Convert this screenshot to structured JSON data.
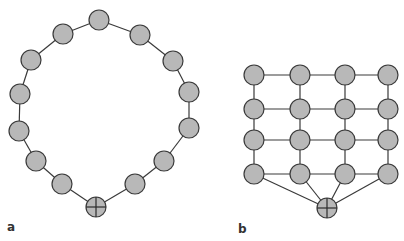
{
  "panels": [
    {
      "label": "a",
      "topology": "ring",
      "node_radius": 10,
      "nodes": [
        {
          "x": 99,
          "y": 20
        },
        {
          "x": 140,
          "y": 35
        },
        {
          "x": 173,
          "y": 61
        },
        {
          "x": 189,
          "y": 92
        },
        {
          "x": 189,
          "y": 128
        },
        {
          "x": 164,
          "y": 161
        },
        {
          "x": 135,
          "y": 184
        },
        {
          "x": 96,
          "y": 207,
          "hub": true
        },
        {
          "x": 62,
          "y": 184
        },
        {
          "x": 36,
          "y": 161
        },
        {
          "x": 19,
          "y": 131
        },
        {
          "x": 20,
          "y": 94
        },
        {
          "x": 31,
          "y": 60
        },
        {
          "x": 63,
          "y": 34
        }
      ],
      "edges": "ring"
    },
    {
      "label": "b",
      "topology": "grid-4x4-with-hub",
      "node_radius": 10,
      "columns": [
        254,
        300,
        345,
        388
      ],
      "rows": [
        75,
        109,
        140,
        174
      ],
      "hub": {
        "x": 327,
        "y": 208
      }
    }
  ],
  "labels": {
    "a": "a",
    "b": "b"
  }
}
